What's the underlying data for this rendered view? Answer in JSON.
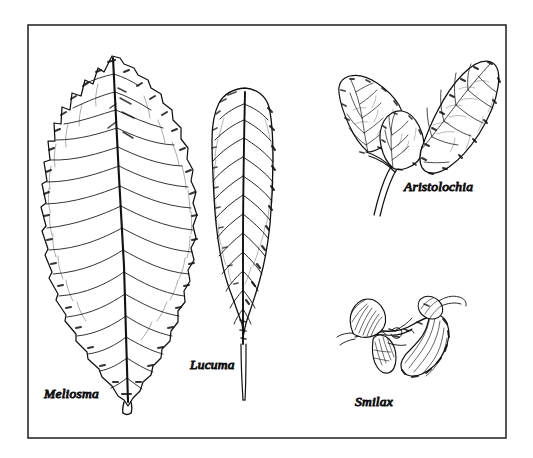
{
  "plate": {
    "name": "botanical-leaf-plate",
    "background_color": "#ffffff",
    "ink_color": "#111111",
    "border": {
      "color": "#2b2b2b",
      "x": 28,
      "y": 25,
      "width": 478,
      "height": 413,
      "stroke_width": 1.6
    },
    "medium": "pen-and-ink line drawing",
    "figure_count": 4
  },
  "figures": [
    {
      "id": "meliosma",
      "label": "Meliosma",
      "label_x": 44,
      "label_y": 398,
      "description": "elongate elliptic leaf with serrate toothed margin and pinnate venation, tapering to a short stout petiole",
      "margin": "serrate",
      "venation": "pinnate",
      "position": "left",
      "tip_x": 112,
      "tip_y": 56,
      "base_x": 128,
      "base_y": 412
    },
    {
      "id": "lucuma",
      "label": "Lucuma",
      "label_x": 190,
      "label_y": 369,
      "description": "obovate leaf with entire smooth margin and blunt rounded apex, narrowing into a long slender petiole",
      "margin": "entire",
      "venation": "pinnate",
      "position": "center",
      "tip_x": 245,
      "tip_y": 88,
      "base_x": 243,
      "base_y": 400
    },
    {
      "id": "aristolochia",
      "label": "Aristolochia",
      "label_x": 404,
      "label_y": 191,
      "description": "cluster of cordate heart-shaped leaves on a forking vine stem with reticulate netted venation",
      "margin": "entire",
      "venation": "reticulate",
      "position": "top-right"
    },
    {
      "id": "smilax",
      "label": "Smilax",
      "label_x": 355,
      "label_y": 406,
      "description": "crumpled folded shoot with curled leaves and twining tendrils",
      "margin": "undulate",
      "venation": "parallel-arcuate",
      "position": "bottom-right"
    }
  ]
}
